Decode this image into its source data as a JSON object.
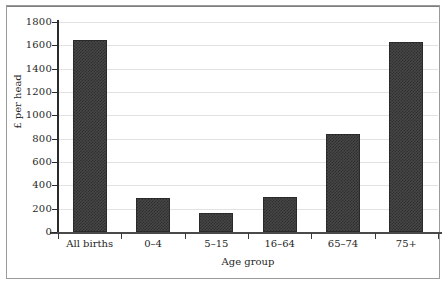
{
  "figure": {
    "background_color": "#ffffff",
    "frame_color": "#9a9a9a",
    "bar_color": "#3a3a3a",
    "gridline_color": "#e2e2e2",
    "axis_color": "#2b2b2b"
  },
  "chart_data": {
    "type": "bar",
    "title": "",
    "subtitle": "",
    "xlabel": "Age group",
    "ylabel": "£ per head",
    "categories": [
      "All births",
      "0–4",
      "5–15",
      "16–64",
      "65–74",
      "75+"
    ],
    "values": [
      1650,
      290,
      160,
      300,
      840,
      1630
    ],
    "ylim": [
      0,
      1800
    ],
    "y_ticks": [
      0,
      200,
      400,
      600,
      800,
      1000,
      1200,
      1400,
      1600,
      1800
    ],
    "y_tick_labels": [
      "0",
      "200",
      "400",
      "600",
      "800",
      "1000",
      "1200",
      "1400",
      "1600",
      "1800"
    ],
    "grid": true,
    "grid_axis": "y",
    "legend": false,
    "legend_position": "none",
    "series": [
      {
        "name": "£ per head",
        "values": [
          1650,
          290,
          160,
          300,
          840,
          1630
        ]
      }
    ],
    "annotations": []
  }
}
